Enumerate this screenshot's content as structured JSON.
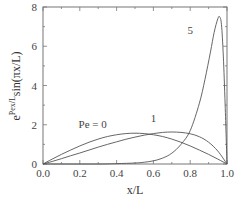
{
  "chart_data": {
    "type": "line",
    "title": "",
    "xlabel": "x/L",
    "ylabel": "e^{Pex/L} sin(πx/L)",
    "ylabel_base": "e",
    "ylabel_exp": "Pex/L",
    "ylabel_tail": "sin(πx/L)",
    "xlim": [
      0.0,
      1.0
    ],
    "ylim": [
      0,
      8
    ],
    "xticks": [
      "0.0",
      "0.2",
      "0.4",
      "0.6",
      "0.8",
      "1.0"
    ],
    "yticks": [
      "0",
      "2",
      "4",
      "6",
      "8"
    ],
    "grid": false,
    "legend": null,
    "annotations": [
      {
        "text": "Pe = 0",
        "x": 0.27,
        "y": 1.85
      },
      {
        "text": "1",
        "x": 0.6,
        "y": 2.15
      },
      {
        "text": "5",
        "x": 0.8,
        "y": 6.6
      }
    ],
    "series": [
      {
        "name": "Pe = 0",
        "x": [
          0,
          0.05,
          0.1,
          0.15,
          0.2,
          0.25,
          0.3,
          0.35,
          0.4,
          0.45,
          0.5,
          0.55,
          0.6,
          0.65,
          0.7,
          0.75,
          0.8,
          0.85,
          0.9,
          0.95,
          1.0
        ],
        "y": [
          0,
          0.25,
          0.49,
          0.71,
          0.92,
          1.11,
          1.27,
          1.4,
          1.49,
          1.55,
          1.57,
          1.55,
          1.49,
          1.4,
          1.27,
          1.11,
          0.92,
          0.71,
          0.49,
          0.25,
          0
        ]
      },
      {
        "name": "Pe = 1",
        "x": [
          0,
          0.05,
          0.1,
          0.15,
          0.2,
          0.25,
          0.3,
          0.35,
          0.4,
          0.45,
          0.5,
          0.55,
          0.6,
          0.65,
          0.7,
          0.75,
          0.8,
          0.85,
          0.9,
          0.95,
          1.0
        ],
        "y": [
          0,
          0.13,
          0.27,
          0.42,
          0.56,
          0.71,
          0.86,
          1.0,
          1.13,
          1.26,
          1.37,
          1.47,
          1.55,
          1.61,
          1.63,
          1.61,
          1.54,
          1.39,
          1.11,
          0.66,
          0
        ]
      },
      {
        "name": "Pe = 5",
        "x": [
          0,
          0.3,
          0.4,
          0.5,
          0.55,
          0.6,
          0.65,
          0.7,
          0.75,
          0.8,
          0.85,
          0.88,
          0.91,
          0.93,
          0.95,
          0.96,
          0.97,
          0.98,
          0.99,
          1.0
        ],
        "y": [
          0,
          0.0,
          0.02,
          0.05,
          0.09,
          0.16,
          0.3,
          0.55,
          1.0,
          1.7,
          3.1,
          4.3,
          5.7,
          6.7,
          7.4,
          7.5,
          7.1,
          5.5,
          3.0,
          0
        ]
      }
    ]
  }
}
